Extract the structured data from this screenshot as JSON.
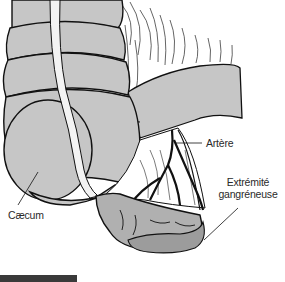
{
  "figure": {
    "labels": {
      "artere": "Artère",
      "extremite_line1": "Extrémité",
      "extremite_line2": "gangréneuse",
      "caecum": "Cæcum"
    },
    "colors": {
      "organ_fill": "#c6c6c6",
      "mesentery_fill": "#ffffff",
      "appendix_fill": "#b0b0b0",
      "gangrene_fill": "#9c9c9c",
      "outline": "#111111",
      "bottom_bar": "#3a3a3a"
    }
  }
}
